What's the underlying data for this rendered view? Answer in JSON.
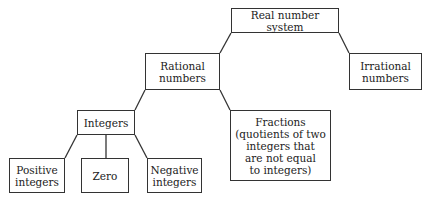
{
  "diagram": {
    "type": "tree",
    "nodes": {
      "real": {
        "label": "Real number system"
      },
      "rational": {
        "label": "Rational numbers"
      },
      "irrational": {
        "label": "Irrational numbers"
      },
      "integers": {
        "label": "Integers"
      },
      "fractions": {
        "label": "Fractions (quotients of two integers that are not equal to integers)"
      },
      "positive": {
        "label": "Positive integers"
      },
      "zero": {
        "label": "Zero"
      },
      "negative": {
        "label": "Negative integers"
      }
    },
    "edges": [
      [
        "real",
        "rational"
      ],
      [
        "real",
        "irrational"
      ],
      [
        "rational",
        "integers"
      ],
      [
        "rational",
        "fractions"
      ],
      [
        "integers",
        "positive"
      ],
      [
        "integers",
        "zero"
      ],
      [
        "integers",
        "negative"
      ]
    ]
  },
  "lines": {
    "real": [
      "Real number system"
    ],
    "rational": [
      "Rational",
      "numbers"
    ],
    "irrational": [
      "Irrational",
      "numbers"
    ],
    "integers": [
      "Integers"
    ],
    "fractions": [
      "Fractions",
      "(quotients of two",
      "integers that",
      "are not equal",
      "to integers)"
    ],
    "positive": [
      "Positive",
      "integers"
    ],
    "zero": [
      "Zero"
    ],
    "negative": [
      "Negative",
      "integers"
    ]
  },
  "colors": {
    "line": "#333333",
    "text": "#222222",
    "background": "#ffffff"
  }
}
